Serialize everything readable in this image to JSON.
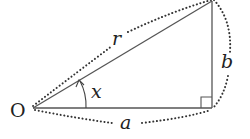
{
  "diagram": {
    "type": "right-triangle",
    "labels": {
      "origin": "O",
      "hypotenuse": "r",
      "vertical_side": "b",
      "horizontal_side": "a",
      "angle": "x"
    },
    "colors": {
      "stroke": "#555555",
      "dots": "#333333",
      "text": "#222222"
    }
  }
}
